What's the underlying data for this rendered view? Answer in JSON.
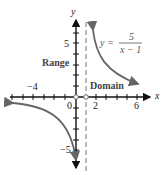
{
  "figure": {
    "function_label": {
      "prefix": "y =",
      "numerator": "5",
      "denominator": "x − 1"
    },
    "axis_labels": {
      "x": "x",
      "y": "y"
    },
    "x_tick_labels": [
      {
        "value": -4,
        "text": "−4"
      },
      {
        "value": 0,
        "text": "0"
      },
      {
        "value": 2,
        "text": "2"
      },
      {
        "value": 6,
        "text": "6"
      }
    ],
    "y_tick_labels": [
      {
        "value": 5,
        "text": "5"
      },
      {
        "value": -5,
        "text": "−5"
      }
    ],
    "region_labels": {
      "range": "Range",
      "domain": "Domain"
    },
    "asymptote": {
      "type": "vertical",
      "x": 1,
      "style": "dashed"
    },
    "open_points": [
      {
        "x": 0,
        "y": 0
      },
      {
        "x": 1,
        "y": 0
      }
    ],
    "colors": {
      "curve": "#666666",
      "axis": "#111111",
      "asymptote": "#777777"
    }
  }
}
